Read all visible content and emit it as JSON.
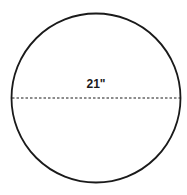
{
  "diagram": {
    "shape": "circle",
    "diameter_label": "21\"",
    "diameter_line_style": "dashed",
    "stroke_color": "#1a1a1a",
    "background": "#ffffff"
  }
}
